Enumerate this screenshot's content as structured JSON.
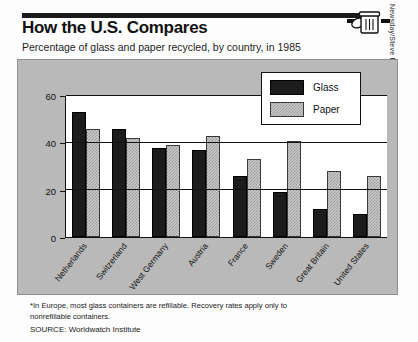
{
  "header": {
    "title": "How the U.S. Compares",
    "subtitle": "Percentage of glass and paper recycled, by country, in 1985",
    "credit": "Newsday/Steve Madden",
    "icon": "trash-can-icon"
  },
  "footer": {
    "footnote": "*In Europe, most glass containers are refillable. Recovery rates apply only to nonrefillable containers.",
    "source": "SOURCE: Worldwatch Institute"
  },
  "chart_data": {
    "type": "bar",
    "title": "How the U.S. Compares",
    "subtitle": "Percentage of glass and paper recycled, by country, in 1985",
    "xlabel": "",
    "ylabel": "",
    "ylim": [
      0,
      60
    ],
    "yticks": [
      0,
      20,
      40,
      60
    ],
    "ytick_labels": [
      "0",
      "20",
      "40",
      "60"
    ],
    "grid": true,
    "legend_position": "top-right",
    "categories": [
      "Netherlands",
      "Switzerland",
      "West Germany",
      "Austria",
      "France",
      "Sweden",
      "Great Britain",
      "United States"
    ],
    "series": [
      {
        "name": "Glass",
        "color": "#1c1c1c",
        "values": [
          53,
          46,
          38,
          37,
          26,
          19,
          12,
          10
        ]
      },
      {
        "name": "Paper",
        "color": "#c9c9c9",
        "values": [
          46,
          42,
          39,
          43,
          33,
          41,
          28,
          26
        ]
      }
    ]
  }
}
